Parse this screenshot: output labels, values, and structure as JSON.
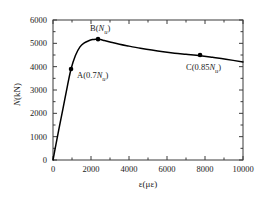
{
  "chart_data": {
    "type": "line",
    "title": "",
    "xlabel": "ε(με)",
    "ylabel": "N(kN)",
    "xlim": [
      0,
      10000
    ],
    "ylim": [
      0,
      6000
    ],
    "xticks": [
      0,
      2000,
      4000,
      6000,
      8000,
      10000
    ],
    "yticks": [
      0,
      1000,
      2000,
      3000,
      4000,
      5000,
      6000
    ],
    "xtick_labels": [
      "0",
      "2000",
      "4000",
      "6000",
      "8000",
      "10000"
    ],
    "ytick_labels": [
      "0",
      "1000",
      "2000",
      "3000",
      "4000",
      "5000",
      "6000"
    ],
    "grid": false,
    "legend": "none",
    "series": [
      {
        "name": "load-strain curve",
        "color": "#000000",
        "x": [
          0,
          120,
          300,
          520,
          760,
          950,
          1180,
          1420,
          1650,
          1880,
          2080,
          2250,
          2370,
          2500,
          2700,
          3000,
          3500,
          4000,
          4600,
          5200,
          5800,
          6400,
          7000,
          7740,
          8400,
          9100,
          10000
        ],
        "y": [
          0,
          520,
          1280,
          2180,
          3180,
          3900,
          4480,
          4850,
          5020,
          5110,
          5160,
          5180,
          5180,
          5160,
          5120,
          5060,
          4960,
          4880,
          4790,
          4710,
          4640,
          4580,
          4530,
          4470,
          4400,
          4320,
          4200
        ]
      }
    ],
    "markers": [
      {
        "id": "A",
        "label": "A(0.7N",
        "label_sub": "u",
        "label_tail": ")",
        "x": 950,
        "y": 3900
      },
      {
        "id": "B",
        "label": "B(N",
        "label_sub": "u",
        "label_tail": ")",
        "x": 2370,
        "y": 5180
      },
      {
        "id": "C",
        "label": "C(0.85N",
        "label_sub": "u",
        "label_tail": ")",
        "x": 7740,
        "y": 4500
      }
    ],
    "colors": {
      "line": "#000000",
      "axes": "#3a3a3a",
      "marker": "#000000",
      "background": "#ffffff"
    }
  }
}
